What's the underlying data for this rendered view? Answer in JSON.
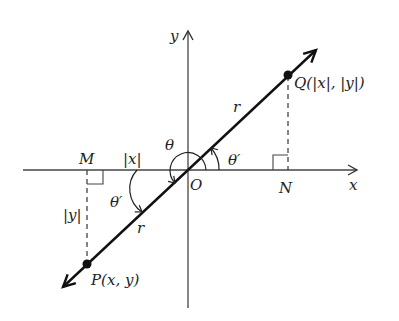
{
  "diagram": {
    "axes": {
      "x_label": "x",
      "y_label": "y",
      "origin_label": "O"
    },
    "points": {
      "P": {
        "label": "P(x, y)"
      },
      "Q": {
        "label": "Q(|x|, |y|)"
      },
      "M": {
        "label": "M"
      },
      "N": {
        "label": "N"
      }
    },
    "segment_labels": {
      "r_upper": "r",
      "r_lower": "r",
      "abs_x": "|x|",
      "abs_y": "|y|"
    },
    "angle_labels": {
      "theta": "θ",
      "theta_prime_upper": "θ′",
      "theta_prime_lower": "θ′"
    },
    "colors": {
      "ink": "#1a1a1a",
      "axis": "#444444",
      "background": "#ffffff"
    }
  }
}
